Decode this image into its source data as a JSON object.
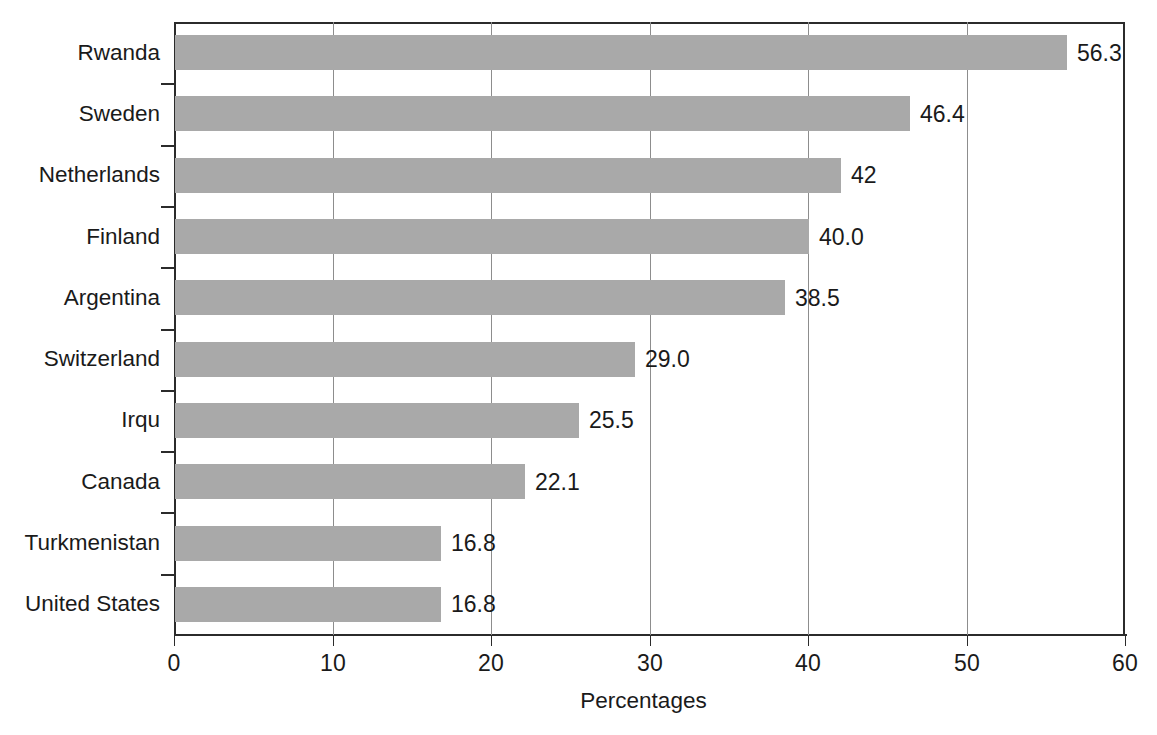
{
  "chart_data": {
    "type": "bar",
    "orientation": "horizontal",
    "title": "",
    "xlabel": "Percentages",
    "ylabel": "",
    "xlim": [
      0,
      60
    ],
    "xticks": [
      0,
      10,
      20,
      30,
      40,
      50,
      60
    ],
    "xtick_labels": [
      "0",
      "10",
      "20",
      "30",
      "40",
      "50",
      "60"
    ],
    "grid": true,
    "grid_axis": "x",
    "legend": false,
    "bar_color": "#a9a9a9",
    "axis_color": "#2b2b2b",
    "gridline_color": "#8d8d8d",
    "categories": [
      "Rwanda",
      "Sweden",
      "Netherlands",
      "Finland",
      "Argentina",
      "Switzerland",
      "Irqu",
      "Canada",
      "Turkmenistan",
      "United States"
    ],
    "values": [
      56.3,
      46.4,
      42,
      40.0,
      38.5,
      29.0,
      25.5,
      22.1,
      16.8,
      16.8
    ],
    "value_labels": [
      "56.3",
      "46.4",
      "42",
      "40.0",
      "38.5",
      "29.0",
      "25.5",
      "22.1",
      "16.8",
      "16.8"
    ],
    "bars": [
      {
        "category": "Rwanda",
        "value": 56.3,
        "label": "56.3"
      },
      {
        "category": "Sweden",
        "value": 46.4,
        "label": "46.4"
      },
      {
        "category": "Netherlands",
        "value": 42,
        "label": "42"
      },
      {
        "category": "Finland",
        "value": 40.0,
        "label": "40.0"
      },
      {
        "category": "Argentina",
        "value": 38.5,
        "label": "38.5"
      },
      {
        "category": "Switzerland",
        "value": 29.0,
        "label": "29.0"
      },
      {
        "category": "Irqu",
        "value": 25.5,
        "label": "25.5"
      },
      {
        "category": "Canada",
        "value": 22.1,
        "label": "22.1"
      },
      {
        "category": "Turkmenistan",
        "value": 16.8,
        "label": "16.8"
      },
      {
        "category": "United States",
        "value": 16.8,
        "label": "16.8"
      }
    ]
  }
}
